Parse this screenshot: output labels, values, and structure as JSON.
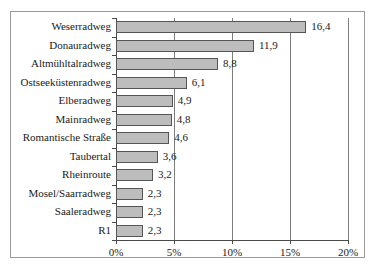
{
  "chart_data": {
    "type": "bar",
    "orientation": "horizontal",
    "title": "",
    "subtitle": "",
    "xlabel": "",
    "ylabel": "",
    "xlim": [
      0,
      20
    ],
    "grid": true,
    "legend": null,
    "value_suffix": "%",
    "decimal_separator": ",",
    "xticks": [
      {
        "value": 0,
        "label": "0%"
      },
      {
        "value": 5,
        "label": "5%"
      },
      {
        "value": 10,
        "label": "10%"
      },
      {
        "value": 15,
        "label": "15%"
      },
      {
        "value": 20,
        "label": "20%"
      }
    ],
    "categories": [
      "Weserradweg",
      "Donauradweg",
      "Altmühltalradweg",
      "Ostseeküstenradweg",
      "Elberadweg",
      "Mainradweg",
      "Romantische Straße",
      "Taubertal",
      "Rheinroute",
      "Mosel/Saarradweg",
      "Saaleradweg",
      "R1"
    ],
    "values": [
      16.4,
      11.9,
      8.8,
      6.1,
      4.9,
      4.8,
      4.6,
      3.6,
      3.2,
      2.3,
      2.3,
      2.3
    ],
    "value_labels": [
      "16,4",
      "11,9",
      "8,8",
      "6,1",
      "4,9",
      "4,8",
      "4,6",
      "3,6",
      "3,2",
      "2,3",
      "2,3",
      "2,3"
    ],
    "colors": {
      "bar_fill": "#bdbdbd",
      "bar_border": "#555555",
      "gridline": "#7d7d7d",
      "axis": "#4a4a4a",
      "frame": "#9a9a9a",
      "text": "#1a1a1a",
      "background": "#ffffff"
    }
  }
}
